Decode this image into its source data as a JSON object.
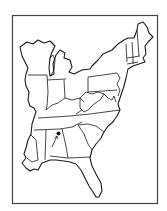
{
  "map": {
    "title": "Eastern United States outline map",
    "region": "Eastern United States",
    "states_shown": [
      "Wisconsin",
      "Michigan",
      "Illinois",
      "Indiana",
      "Ohio",
      "Kentucky",
      "Tennessee",
      "Mississippi",
      "Alabama",
      "Georgia",
      "Florida",
      "South Carolina",
      "North Carolina",
      "Virginia",
      "West Virginia",
      "Pennsylvania",
      "New York",
      "Maryland",
      "Delaware",
      "New Jersey",
      "Connecticut",
      "Rhode Island",
      "Massachusetts",
      "Vermont",
      "New Hampshire",
      "Maine",
      "Louisiana (partial)"
    ],
    "marker": {
      "label": "location-marker",
      "state": "Alabama",
      "position": "northern Alabama"
    },
    "colors": {
      "line": "#1a1a1a",
      "background": "#ffffff",
      "frame": "#444444"
    }
  }
}
